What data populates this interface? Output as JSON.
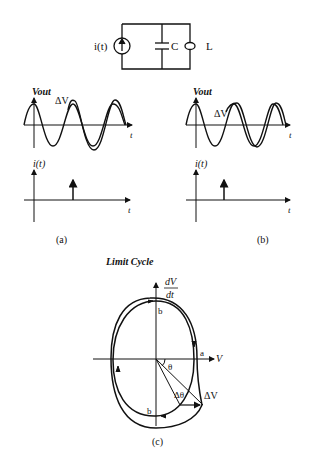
{
  "circuit": {
    "source_label": "i(t)",
    "capacitor_label": "C",
    "inductor_label": "L"
  },
  "panel_a": {
    "caption": "(a)",
    "vout_axis_label": "Vout",
    "delta_label": "ΔV",
    "t_label": "t",
    "i_axis_label": "i(t)",
    "i_t_label": "t"
  },
  "panel_b": {
    "caption": "(b)",
    "vout_axis_label": "Vout",
    "delta_label": "ΔV",
    "t_label": "t",
    "i_axis_label": "i(t)",
    "i_t_label": "t"
  },
  "panel_c": {
    "title": "Limit Cycle",
    "y_axis_num": "dV",
    "y_axis_den": "dt",
    "x_axis_label": "V",
    "point_a": "a",
    "point_b_top": "b",
    "point_b_bottom": "b",
    "theta": "θ",
    "delta_theta": "Δθ",
    "delta_v": "ΔV",
    "caption": "(c)"
  }
}
